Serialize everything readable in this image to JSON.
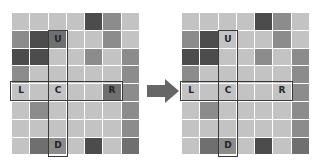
{
  "diagram": {
    "rows": 8,
    "cols": 7,
    "shade_colors": {
      "light": "#c3c3c3",
      "mid": "#8c8c8c",
      "middark": "#6f6f6f",
      "dark": "#4c4c4c"
    },
    "left_grid": {
      "cells": [
        [
          0,
          0,
          0,
          0,
          3,
          1,
          0
        ],
        [
          1,
          3,
          2,
          0,
          0,
          1,
          0
        ],
        [
          3,
          3,
          0,
          0,
          1,
          0,
          1
        ],
        [
          1,
          0,
          0,
          0,
          0,
          0,
          1
        ],
        [
          0,
          0,
          0,
          0,
          0,
          2,
          1
        ],
        [
          0,
          1,
          0,
          0,
          0,
          0,
          1
        ],
        [
          0,
          0,
          0,
          0,
          0,
          0,
          1
        ],
        [
          0,
          2,
          1,
          0,
          3,
          0,
          2
        ]
      ]
    },
    "right_grid": {
      "cells": [
        [
          0,
          0,
          0,
          0,
          3,
          1,
          0
        ],
        [
          1,
          3,
          0,
          0,
          0,
          1,
          0
        ],
        [
          3,
          3,
          0,
          0,
          1,
          0,
          1
        ],
        [
          1,
          0,
          0,
          0,
          0,
          0,
          1
        ],
        [
          0,
          0,
          0,
          0,
          0,
          0,
          1
        ],
        [
          0,
          1,
          0,
          0,
          0,
          0,
          1
        ],
        [
          0,
          0,
          0,
          0,
          0,
          0,
          1
        ],
        [
          0,
          2,
          1,
          0,
          3,
          0,
          2
        ]
      ]
    },
    "labels": {
      "up": "U",
      "left": "L",
      "center": "C",
      "right": "R",
      "down": "D"
    },
    "label_positions": {
      "up": [
        1,
        2
      ],
      "left": [
        4,
        0
      ],
      "center": [
        4,
        2
      ],
      "right": [
        4,
        5
      ],
      "down": [
        7,
        2
      ]
    },
    "arrow": {
      "direction": "right",
      "color": "#666666"
    }
  }
}
